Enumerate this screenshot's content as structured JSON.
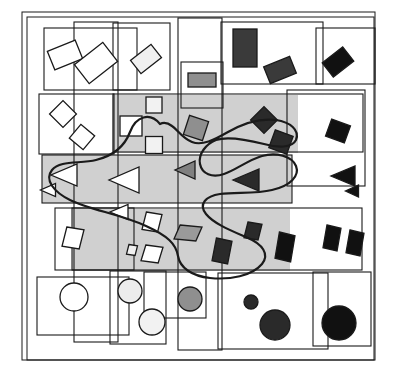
{
  "figure": {
    "background_color": "#ffffff",
    "stroke_color": "#1a1a1a",
    "shaded_region_color": "#d0d0d0",
    "width": 396,
    "height": 374
  },
  "outer_frames": [
    {
      "name": "outer-frame-1",
      "x": 22,
      "y": 12,
      "w": 353,
      "h": 348
    },
    {
      "name": "outer-frame-2",
      "x": 27,
      "y": 17,
      "w": 347,
      "h": 343
    }
  ],
  "shaded_regions": [
    {
      "name": "shaded-band-rectangles",
      "x": 112,
      "y": 95,
      "w": 186,
      "h": 58,
      "color": "#d0d0d0"
    },
    {
      "name": "shaded-band-triangles",
      "x": 42,
      "y": 155,
      "w": 250,
      "h": 48,
      "color": "#d0d0d0"
    },
    {
      "name": "shaded-band-parallelograms",
      "x": 72,
      "y": 209,
      "w": 218,
      "h": 62,
      "color": "#d0d0d0"
    }
  ],
  "cluster_boxes": [
    {
      "name": "cluster-box-r1-a",
      "x": 44,
      "y": 28,
      "w": 93,
      "h": 62
    },
    {
      "name": "cluster-box-r1-b",
      "x": 113,
      "y": 23,
      "w": 57,
      "h": 67
    },
    {
      "name": "cluster-box-r1-c",
      "x": 221,
      "y": 22,
      "w": 102,
      "h": 62
    },
    {
      "name": "cluster-box-r1-d",
      "x": 316,
      "y": 28,
      "w": 59,
      "h": 56
    },
    {
      "name": "cluster-box-small-gray",
      "x": 181,
      "y": 62,
      "w": 42,
      "h": 46
    },
    {
      "name": "cluster-box-r2-a",
      "x": 39,
      "y": 94,
      "w": 75,
      "h": 60
    },
    {
      "name": "cluster-box-r2-b",
      "x": 113,
      "y": 94,
      "w": 250,
      "h": 58
    },
    {
      "name": "cluster-box-r3-a",
      "x": 42,
      "y": 155,
      "w": 250,
      "h": 48
    },
    {
      "name": "cluster-box-r3-b",
      "x": 287,
      "y": 90,
      "w": 78,
      "h": 96
    },
    {
      "name": "cluster-box-r4-a",
      "x": 55,
      "y": 208,
      "w": 79,
      "h": 62
    },
    {
      "name": "cluster-box-r4-b",
      "x": 72,
      "y": 208,
      "w": 290,
      "h": 62
    },
    {
      "name": "cluster-box-r5-a",
      "x": 37,
      "y": 277,
      "w": 92,
      "h": 58
    },
    {
      "name": "cluster-box-r5-b",
      "x": 110,
      "y": 271,
      "w": 56,
      "h": 73
    },
    {
      "name": "cluster-box-r5-c",
      "x": 144,
      "y": 272,
      "w": 62,
      "h": 46
    },
    {
      "name": "cluster-box-r5-d",
      "x": 218,
      "y": 273,
      "w": 110,
      "h": 76
    },
    {
      "name": "cluster-box-r5-e",
      "x": 313,
      "y": 272,
      "w": 58,
      "h": 74
    },
    {
      "name": "cluster-box-vert-left",
      "x": 74,
      "y": 22,
      "w": 44,
      "h": 320
    },
    {
      "name": "cluster-box-vert-mid",
      "x": 178,
      "y": 18,
      "w": 44,
      "h": 332
    }
  ],
  "shape_rows": [
    {
      "row": 1,
      "shape": "rectangle",
      "items": [
        {
          "name": "rect-1",
          "cx": 65,
          "cy": 55,
          "w": 30,
          "h": 20,
          "rot": -22,
          "fill": "#ffffff"
        },
        {
          "name": "rect-2",
          "cx": 96,
          "cy": 63,
          "w": 36,
          "h": 24,
          "rot": -38,
          "fill": "#ffffff"
        },
        {
          "name": "rect-3",
          "cx": 146,
          "cy": 59,
          "w": 26,
          "h": 17,
          "rot": -38,
          "fill": "#f0f0f0"
        },
        {
          "name": "rect-4",
          "cx": 202,
          "cy": 80,
          "w": 28,
          "h": 14,
          "rot": 0,
          "fill": "#8f8f8f"
        },
        {
          "name": "rect-5",
          "cx": 245,
          "cy": 48,
          "w": 24,
          "h": 38,
          "rot": 0,
          "fill": "#3a3a3a"
        },
        {
          "name": "rect-6",
          "cx": 280,
          "cy": 70,
          "w": 28,
          "h": 18,
          "rot": -22,
          "fill": "#3a3a3a"
        },
        {
          "name": "rect-7",
          "cx": 338,
          "cy": 62,
          "w": 26,
          "h": 18,
          "rot": -38,
          "fill": "#111111"
        }
      ]
    },
    {
      "row": 2,
      "shape": "rectangle",
      "items": [
        {
          "name": "rect-8",
          "cx": 63,
          "cy": 114,
          "w": 19,
          "h": 19,
          "rot": 45,
          "fill": "#ffffff"
        },
        {
          "name": "rect-9",
          "cx": 82,
          "cy": 137,
          "w": 18,
          "h": 18,
          "rot": 40,
          "fill": "#ffffff"
        },
        {
          "name": "rect-10",
          "cx": 131,
          "cy": 126,
          "w": 22,
          "h": 20,
          "rot": 0,
          "fill": "#ffffff"
        },
        {
          "name": "rect-11",
          "cx": 154,
          "cy": 105,
          "w": 16,
          "h": 16,
          "rot": 0,
          "fill": "#f2f2f2"
        },
        {
          "name": "rect-12",
          "cx": 154,
          "cy": 145,
          "w": 17,
          "h": 17,
          "rot": 0,
          "fill": "#f2f2f2"
        },
        {
          "name": "rect-13",
          "cx": 196,
          "cy": 128,
          "w": 20,
          "h": 20,
          "rot": 18,
          "fill": "#8f8f8f"
        },
        {
          "name": "rect-14",
          "cx": 264,
          "cy": 120,
          "w": 19,
          "h": 19,
          "rot": 45,
          "fill": "#2a2a2a"
        },
        {
          "name": "rect-15",
          "cx": 281,
          "cy": 142,
          "w": 19,
          "h": 19,
          "rot": 20,
          "fill": "#2a2a2a"
        },
        {
          "name": "rect-16",
          "cx": 338,
          "cy": 131,
          "w": 20,
          "h": 18,
          "rot": 20,
          "fill": "#111111"
        }
      ]
    },
    {
      "row": 3,
      "shape": "triangle",
      "items": [
        {
          "name": "tri-1",
          "cx": 64,
          "cy": 175,
          "w": 26,
          "h": 22,
          "rot": 0,
          "fill": "#ffffff"
        },
        {
          "name": "tri-2",
          "cx": 48,
          "cy": 190,
          "w": 15,
          "h": 13,
          "rot": 0,
          "fill": "#ffffff"
        },
        {
          "name": "tri-3",
          "cx": 124,
          "cy": 180,
          "w": 30,
          "h": 26,
          "rot": 0,
          "fill": "#ffffff"
        },
        {
          "name": "tri-4",
          "cx": 119,
          "cy": 212,
          "w": 18,
          "h": 15,
          "rot": 0,
          "fill": "#ffffff"
        },
        {
          "name": "tri-5",
          "cx": 185,
          "cy": 170,
          "w": 20,
          "h": 18,
          "rot": 0,
          "fill": "#808080"
        },
        {
          "name": "tri-6",
          "cx": 246,
          "cy": 180,
          "w": 26,
          "h": 22,
          "rot": 0,
          "fill": "#2a2a2a"
        },
        {
          "name": "tri-7",
          "cx": 343,
          "cy": 176,
          "w": 24,
          "h": 20,
          "rot": 0,
          "fill": "#111111"
        },
        {
          "name": "tri-8",
          "cx": 352,
          "cy": 191,
          "w": 13,
          "h": 12,
          "rot": 0,
          "fill": "#111111"
        }
      ]
    },
    {
      "row": 4,
      "shape": "parallelogram",
      "items": [
        {
          "name": "para-1",
          "cx": 73,
          "cy": 238,
          "w": 22,
          "h": 22,
          "rot": 0,
          "fill": "#ffffff"
        },
        {
          "name": "para-2",
          "cx": 152,
          "cy": 222,
          "w": 20,
          "h": 20,
          "rot": 0,
          "fill": "#ffffff"
        },
        {
          "name": "para-3",
          "cx": 132,
          "cy": 250,
          "w": 11,
          "h": 11,
          "rot": 0,
          "fill": "#f0f0f0"
        },
        {
          "name": "para-4",
          "cx": 152,
          "cy": 254,
          "w": 22,
          "h": 18,
          "rot": 0,
          "fill": "#ffffff"
        },
        {
          "name": "para-5",
          "cx": 188,
          "cy": 233,
          "w": 28,
          "h": 16,
          "rot": 0,
          "fill": "#9a9a9a"
        },
        {
          "name": "para-6",
          "cx": 222,
          "cy": 251,
          "w": 20,
          "h": 26,
          "rot": 0,
          "fill": "#2a2a2a"
        },
        {
          "name": "para-7",
          "cx": 253,
          "cy": 231,
          "w": 18,
          "h": 18,
          "rot": 0,
          "fill": "#2a2a2a"
        },
        {
          "name": "para-8",
          "cx": 285,
          "cy": 247,
          "w": 20,
          "h": 30,
          "rot": 0,
          "fill": "#111111"
        },
        {
          "name": "para-9",
          "cx": 332,
          "cy": 238,
          "w": 18,
          "h": 26,
          "rot": 0,
          "fill": "#111111"
        },
        {
          "name": "para-10",
          "cx": 355,
          "cy": 243,
          "w": 18,
          "h": 26,
          "rot": 0,
          "fill": "#111111"
        }
      ]
    },
    {
      "row": 5,
      "shape": "circle",
      "items": [
        {
          "name": "circle-1",
          "cx": 74,
          "cy": 297,
          "r": 14,
          "fill": "#ffffff"
        },
        {
          "name": "circle-2",
          "cx": 130,
          "cy": 291,
          "r": 12,
          "fill": "#ececec"
        },
        {
          "name": "circle-3",
          "cx": 152,
          "cy": 322,
          "r": 13,
          "fill": "#f2f2f2"
        },
        {
          "name": "circle-4",
          "cx": 190,
          "cy": 299,
          "r": 12,
          "fill": "#8f8f8f"
        },
        {
          "name": "circle-5",
          "cx": 251,
          "cy": 302,
          "r": 7,
          "fill": "#2a2a2a"
        },
        {
          "name": "circle-6",
          "cx": 275,
          "cy": 325,
          "r": 15,
          "fill": "#2a2a2a"
        },
        {
          "name": "circle-7",
          "cx": 339,
          "cy": 323,
          "r": 17,
          "fill": "#111111"
        }
      ]
    }
  ],
  "region_curve": {
    "name": "freeform-region-curve",
    "stroke": "#1a1a1a",
    "stroke_width": 2.2,
    "path": "M 160 124 C 150 112 136 116 130 132 C 124 148 112 156 96 160 C 80 164 60 160 52 170 C 44 180 54 192 70 200 C 90 210 120 214 146 226 C 168 236 176 244 178 256 C 180 268 192 276 210 278 C 230 280 252 276 262 264 C 270 254 262 244 248 238 C 232 231 214 224 206 214 C 198 204 206 196 220 194 C 236 192 256 194 272 190 C 290 186 300 176 296 166 C 292 156 276 152 262 156 C 248 160 236 170 224 174 C 212 178 202 174 200 164 C 198 154 206 144 216 140 C 228 136 248 140 264 144 C 278 148 292 148 296 140 C 300 130 290 122 276 120 C 260 118 242 124 228 132 C 214 140 202 146 192 142 C 182 138 178 130 172 126 C 168 123 164 122 160 124 Z"
  }
}
